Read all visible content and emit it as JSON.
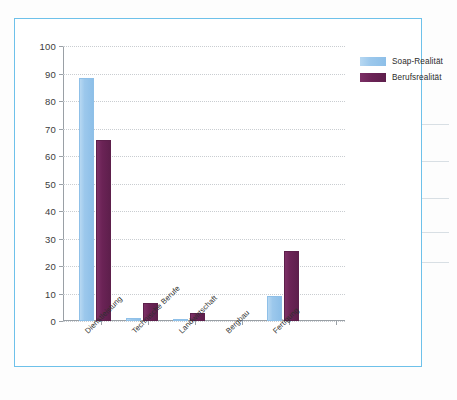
{
  "figure": {
    "frame_color": "#6ec1ea"
  },
  "chart_data": {
    "type": "bar",
    "title": "",
    "xlabel": "",
    "ylabel": "",
    "ylim": [
      0,
      100
    ],
    "ytick_step": 10,
    "yticks": [
      "100",
      "90",
      "80",
      "70",
      "60",
      "50",
      "40",
      "30",
      "20",
      "10",
      "0"
    ],
    "grid": true,
    "grid_axis": "y",
    "legend_position": "top-right",
    "categories": [
      "Dienstleistung",
      "Technische Berufe",
      "Landwirtschaft",
      "Bergbau",
      "Fertigung"
    ],
    "series": [
      {
        "name": "Soap-Realität",
        "color": "#9CC8EC",
        "values": [
          88.5,
          1.0,
          0.5,
          0,
          9.0
        ]
      },
      {
        "name": "Berufsrealität",
        "color": "#6B2356",
        "values": [
          66.0,
          6.5,
          3.0,
          0,
          25.5
        ]
      }
    ]
  }
}
